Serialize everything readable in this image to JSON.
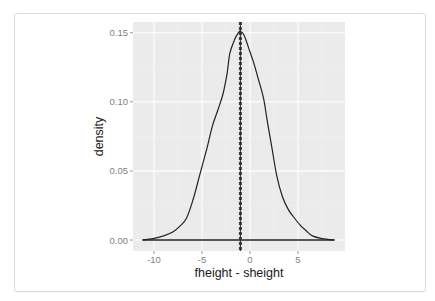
{
  "chart_data": {
    "type": "line",
    "subtype": "density",
    "title": "",
    "xlabel": "fheight - sheight",
    "ylabel": "density",
    "xlim": [
      -12.1,
      9.9
    ],
    "ylim": [
      -0.008,
      0.158
    ],
    "x_ticks": [
      -10,
      -5,
      0,
      5
    ],
    "x_tick_labels": [
      "-10",
      "-5",
      "0",
      "5"
    ],
    "y_ticks": [
      0.0,
      0.05,
      0.1,
      0.15
    ],
    "y_tick_labels": [
      "0.00",
      "0.05",
      "0.10",
      "0.15"
    ],
    "grid": true,
    "legend": "none",
    "series": [
      {
        "name": "density",
        "x": [
          -11.2,
          -10.1,
          -9.0,
          -8.0,
          -7.3,
          -6.6,
          -5.9,
          -5.2,
          -4.5,
          -3.9,
          -3.3,
          -2.8,
          -2.4,
          -2.1,
          -1.6,
          -1.2,
          -1.0,
          -0.6,
          0.0,
          0.4,
          0.8,
          1.4,
          1.8,
          2.3,
          2.8,
          3.4,
          4.0,
          4.5,
          5.2,
          5.8,
          6.5,
          7.5,
          8.8
        ],
        "y": [
          0.0,
          0.001,
          0.003,
          0.006,
          0.01,
          0.016,
          0.03,
          0.048,
          0.066,
          0.083,
          0.095,
          0.106,
          0.12,
          0.135,
          0.145,
          0.15,
          0.151,
          0.148,
          0.136,
          0.128,
          0.118,
          0.103,
          0.086,
          0.066,
          0.046,
          0.031,
          0.022,
          0.017,
          0.011,
          0.007,
          0.003,
          0.001,
          0.0
        ]
      }
    ],
    "vlines": [
      {
        "name": "mean",
        "x": -1.0,
        "style": "dashed"
      },
      {
        "name": "median",
        "x": -1.0,
        "style": "solid"
      }
    ]
  },
  "colors": {
    "panel_bg": "#ebebeb",
    "grid_major": "#ffffff",
    "grid_minor": "#f2f2f2",
    "line": "#222222",
    "vline": "#444444"
  }
}
